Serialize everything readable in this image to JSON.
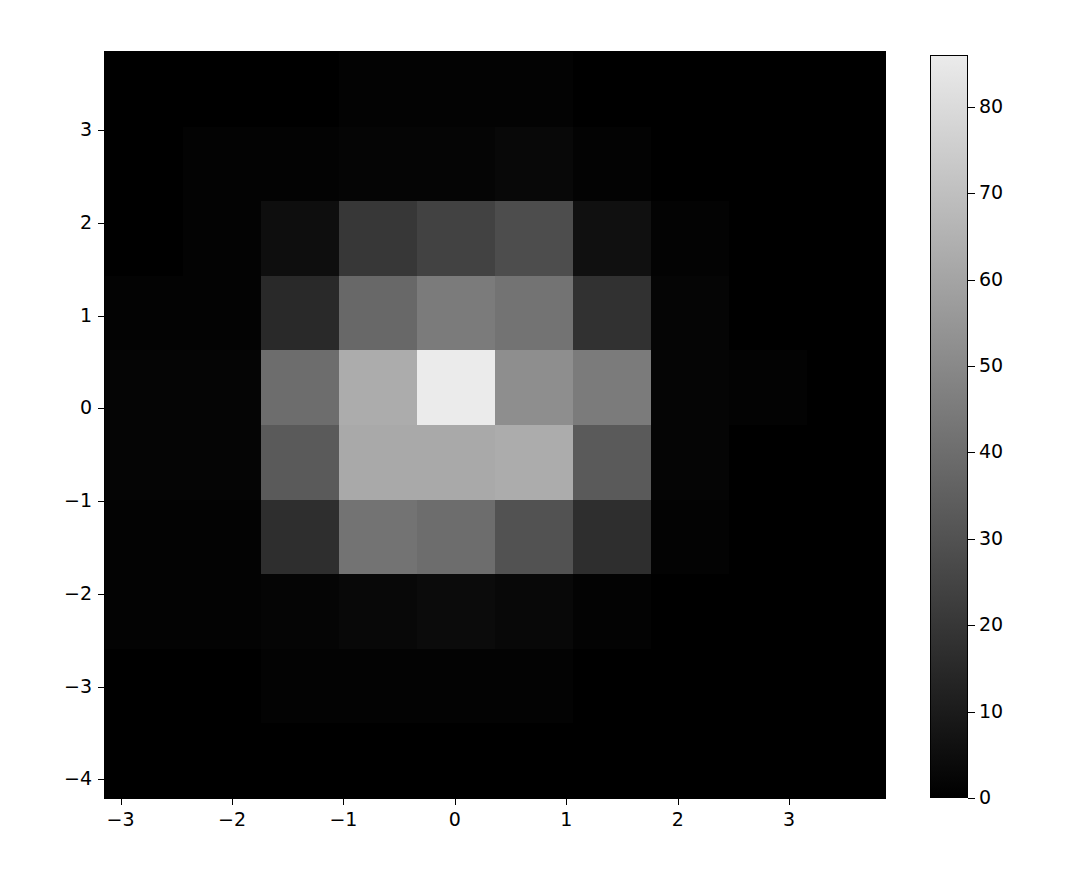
{
  "chart_data": {
    "type": "heatmap",
    "title": "",
    "xlabel": "",
    "ylabel": "",
    "colormap": "gray",
    "xlim": [
      -3.14,
      3.86
    ],
    "ylim": [
      -4.2,
      3.84
    ],
    "x_ticks": [
      -3,
      -2,
      -1,
      0,
      1,
      2,
      3
    ],
    "x_tick_labels": [
      "−3",
      "−2",
      "−1",
      "0",
      "1",
      "2",
      "3"
    ],
    "y_ticks": [
      3,
      2,
      1,
      0,
      -1,
      -2,
      -3,
      -4
    ],
    "y_tick_labels": [
      "3",
      "2",
      "1",
      "0",
      "−1",
      "−2",
      "−3",
      "−4"
    ],
    "x_cell_centers": [
      -2.79,
      -2.09,
      -1.39,
      -0.69,
      0.01,
      0.71,
      1.41,
      2.11,
      2.81,
      3.51
    ],
    "y_cell_centers": [
      3.44,
      2.64,
      1.84,
      1.04,
      0.24,
      -0.56,
      -1.36,
      -2.16,
      -2.96,
      -3.76
    ],
    "values": [
      [
        0,
        0,
        0,
        1,
        1,
        1,
        0,
        0,
        0,
        0
      ],
      [
        0,
        1,
        1,
        2,
        2,
        3,
        1,
        0,
        0,
        0
      ],
      [
        0,
        1,
        5,
        20,
        24,
        28,
        6,
        1,
        0,
        0
      ],
      [
        1,
        1,
        15,
        38,
        45,
        42,
        18,
        2,
        0,
        0
      ],
      [
        2,
        2,
        40,
        63,
        86,
        52,
        45,
        2,
        1,
        0
      ],
      [
        2,
        2,
        33,
        62,
        62,
        63,
        33,
        2,
        0,
        0
      ],
      [
        1,
        1,
        17,
        42,
        40,
        30,
        17,
        1,
        0,
        0
      ],
      [
        1,
        1,
        2,
        3,
        4,
        3,
        1,
        0,
        0,
        0
      ],
      [
        0,
        0,
        1,
        1,
        1,
        1,
        0,
        0,
        0,
        0
      ],
      [
        0,
        0,
        0,
        0,
        0,
        0,
        0,
        0,
        0,
        0
      ]
    ],
    "colorbar": {
      "vmin": 0,
      "vmax": 86,
      "ticks": [
        0,
        10,
        20,
        30,
        40,
        50,
        60,
        70,
        80
      ],
      "tick_labels": [
        "0",
        "10",
        "20",
        "30",
        "40",
        "50",
        "60",
        "70",
        "80"
      ]
    },
    "grid": false,
    "legend": null
  }
}
